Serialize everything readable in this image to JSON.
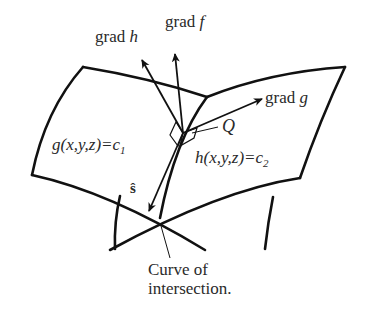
{
  "figure": {
    "labels": {
      "grad_h": {
        "prefix": "grad ",
        "var": "h"
      },
      "grad_f": {
        "prefix": "grad ",
        "var": "f"
      },
      "grad_g": {
        "prefix": "grad ",
        "var": "g"
      },
      "point_q": "Q",
      "surface_g": {
        "lhs": "g(x,y,z)=c",
        "sub": "1"
      },
      "surface_h": {
        "lhs": "h(x,y,z)=c",
        "sub": "2"
      },
      "tangent_s": "ŝ",
      "caption_line1": "Curve of",
      "caption_line2": "intersection."
    },
    "colors": {
      "ink": "#1a1a1a",
      "background": "#ffffff"
    }
  }
}
